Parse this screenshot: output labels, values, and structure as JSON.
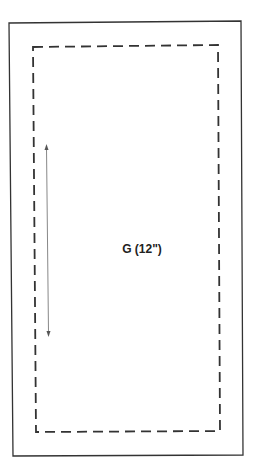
{
  "diagram": {
    "label": "G (12\")",
    "colors": {
      "outer_border": "#333333",
      "dashed_border": "#333333",
      "arrow": "#888888",
      "text": "#222222"
    }
  }
}
